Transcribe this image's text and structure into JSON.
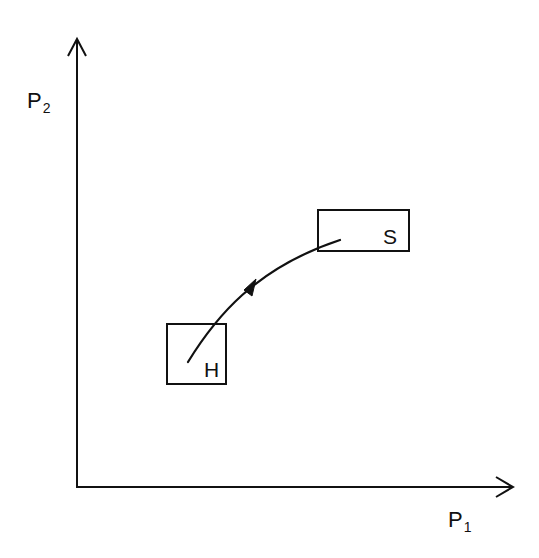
{
  "diagram": {
    "type": "state-transition-plot",
    "axes": {
      "y_axis": {
        "label_main": "P",
        "label_sub": "2"
      },
      "x_axis": {
        "label_main": "P",
        "label_sub": "1"
      }
    },
    "nodes": [
      {
        "id": "H",
        "label": "H"
      },
      {
        "id": "S",
        "label": "S"
      }
    ],
    "edges": [
      {
        "from": "H",
        "to": "S",
        "style": "curved-arrow"
      }
    ],
    "colors": {
      "stroke": "#111111",
      "background": "#ffffff"
    }
  }
}
